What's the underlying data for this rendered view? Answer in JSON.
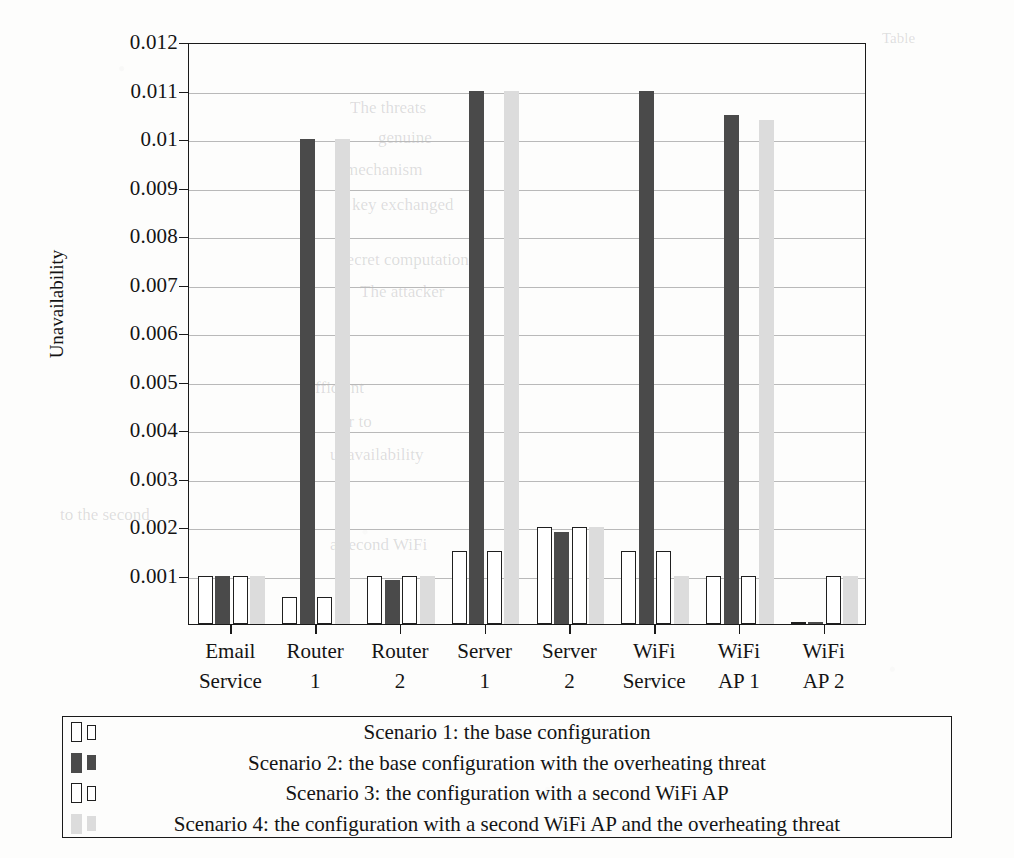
{
  "chart_data": {
    "type": "bar",
    "title": "",
    "xlabel": "",
    "ylabel": "Unavailability",
    "ylim": [
      0,
      0.012
    ],
    "grid": true,
    "legend_position": "bottom",
    "categories": [
      "Email Service",
      "Router 1",
      "Router 2",
      "Server 1",
      "Server 2",
      "WiFi Service",
      "WiFi AP 1",
      "WiFi AP 2"
    ],
    "category_lines": [
      [
        "Email",
        "Service"
      ],
      [
        "Router",
        "1"
      ],
      [
        "Router",
        "2"
      ],
      [
        "Server",
        "1"
      ],
      [
        "Server",
        "2"
      ],
      [
        "WiFi",
        "Service"
      ],
      [
        "WiFi",
        "AP 1"
      ],
      [
        "WiFi",
        "AP 2"
      ]
    ],
    "ytick_labels": [
      "0.001",
      "0.002",
      "0.003",
      "0.004",
      "0.005",
      "0.006",
      "0.007",
      "0.008",
      "0.009",
      "0.01",
      "0.011",
      "0.012"
    ],
    "ytick_values": [
      0.001,
      0.002,
      0.003,
      0.004,
      0.005,
      0.006,
      0.007,
      0.008,
      0.009,
      0.01,
      0.011,
      0.012
    ],
    "series": [
      {
        "name": "Scenario 1: the base configuration",
        "key": "s1",
        "color": "#ffffff",
        "edge_color": "#1f1f1f",
        "values": [
          0.001,
          0.00055,
          0.001,
          0.0015,
          0.002,
          0.0015,
          0.001,
          4e-05
        ]
      },
      {
        "name": "Scenario 2: the base configuration with the overheating threat",
        "key": "s2",
        "color": "#4a4a4a",
        "edge_color": "#4a4a4a",
        "values": [
          0.001,
          0.01,
          0.0009,
          0.011,
          0.0019,
          0.011,
          0.0105,
          4e-05
        ]
      },
      {
        "name": "Scenario 3: the configuration with a second WiFi AP",
        "key": "s3",
        "color": "#ffffff",
        "edge_color": "#1f1f1f",
        "values": [
          0.001,
          0.00055,
          0.001,
          0.0015,
          0.002,
          0.0015,
          0.001,
          0.001
        ]
      },
      {
        "name": "Scenario 4: the configuration with a second WiFi AP and the overheating threat",
        "key": "s4",
        "color": "#dcdcdc",
        "edge_color": "#dcdcdc",
        "values": [
          0.001,
          0.01,
          0.001,
          0.011,
          0.002,
          0.001,
          0.0104,
          0.001
        ]
      }
    ]
  },
  "legend": {
    "entries": [
      "Scenario 1: the base configuration",
      "Scenario 2: the base configuration with the overheating threat",
      "Scenario 3: the configuration with a second WiFi AP",
      "Scenario 4: the configuration with a second WiFi AP and the overheating threat"
    ]
  },
  "background_ghost_text": [
    "Table",
    "The threats",
    "genuine",
    "mechanism",
    "key exchanged",
    "secret computation",
    "The attacker",
    "sufficient",
    "or to",
    "unavailability",
    "to the second",
    "a second WiFi"
  ]
}
